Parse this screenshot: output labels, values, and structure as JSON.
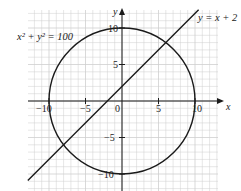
{
  "chart_data": {
    "type": "line",
    "title": "",
    "xlabel": "x",
    "ylabel": "y",
    "xlim": [
      -13,
      13
    ],
    "ylim": [
      -12.3,
      12.5
    ],
    "grid": true,
    "x_ticks": [
      -10,
      -5,
      0,
      5,
      10
    ],
    "y_ticks": [
      -10,
      -5,
      5,
      10
    ],
    "x_tick_labels": [
      "−10",
      "−5",
      "0",
      "5",
      "10"
    ],
    "y_tick_labels": [
      "−10",
      "−5",
      "5",
      "10"
    ],
    "series": [
      {
        "name": "x² + y² = 100",
        "kind": "circle",
        "center": [
          0,
          0
        ],
        "radius": 10,
        "label": "x² + y² = 100"
      },
      {
        "name": "y = x + 2",
        "kind": "line",
        "slope": 1,
        "intercept": 2,
        "x": [
          -12.9,
          10.5
        ],
        "y": [
          -10.9,
          12.5
        ],
        "label": "y = x + 2"
      }
    ],
    "intersections": [
      [
        6,
        8
      ],
      [
        -8,
        -6
      ]
    ],
    "annotations": [
      "x² + y² = 100",
      "y = x + 2"
    ],
    "colors": {
      "curve": "#1a1a1a",
      "grid": "#cfcfcf",
      "axis": "#1a1a1a"
    }
  },
  "labels": {
    "circle_eq": "x² + y² = 100",
    "line_eq": "y = x + 2",
    "x_axis": "x",
    "y_axis": "y",
    "origin": "0",
    "x_ticks": [
      "−10",
      "−5",
      "5",
      "10"
    ],
    "y_ticks": [
      "10",
      "5",
      "−5",
      "−10"
    ]
  }
}
